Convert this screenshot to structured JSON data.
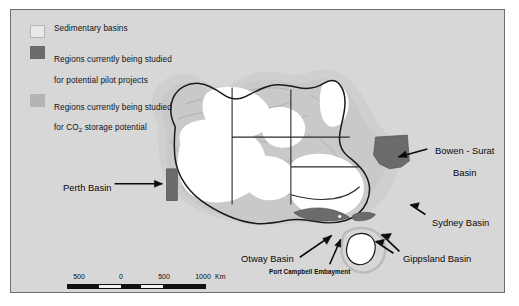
{
  "figure": {
    "background_color": "#ffffff",
    "panel_color": "#d7d7d7",
    "panel_border_color": "#6f6f6f"
  },
  "legend": {
    "items": [
      {
        "swatch": "sedimentary-basins-swatch",
        "color": "#e9e9e9",
        "label": "Sedimentary basins"
      },
      {
        "swatch": "pilot-projects-swatch",
        "color": "#6b6b6b",
        "label_line1": "Regions currently being studied",
        "label_line2": "for potential pilot projects"
      },
      {
        "swatch": "co2-storage-swatch",
        "color": "#b4b4b4",
        "label_line1": "Regions currently being studied",
        "label_line2_pre": " for CO",
        "label_line2_sub": "2",
        "label_line2_post": " storage potential"
      }
    ]
  },
  "map": {
    "land_color": "#ffffff",
    "basin_color": "#c9c9c9",
    "pilot_region_color": "#6b6b6b",
    "coastline_color": "#1a1a1a",
    "state_border_color": "#2a2a2a",
    "labels": [
      {
        "name": "bowen-surat-basin-label",
        "line1": "Bowen - Surat",
        "line2": "Basin"
      },
      {
        "name": "perth-basin-label",
        "text": "Perth Basin"
      },
      {
        "name": "sydney-basin-label",
        "text": "Sydney Basin"
      },
      {
        "name": "gippsland-basin-label",
        "text": "Gippsland Basin"
      },
      {
        "name": "otway-basin-label",
        "text": "Otway Basin"
      },
      {
        "name": "port-campbell-embayment-label",
        "text": "Port Campbell Embayment"
      }
    ]
  },
  "scalebar": {
    "ticks": [
      "500",
      "0",
      "500",
      "1000"
    ],
    "unit": "Km"
  }
}
